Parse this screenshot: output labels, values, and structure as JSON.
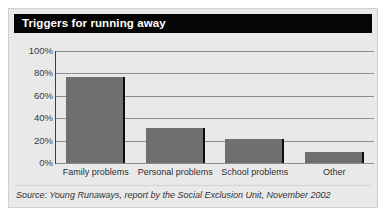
{
  "figure": {
    "title": "Triggers for running away",
    "source": "Source: Young Runaways, report by the Social Exclusion Unit, November 2002",
    "colors": {
      "title_bar": "#050505",
      "title_text": "#ffffff",
      "panel_background": "#e9e9e9",
      "bar_fill": "#6f6f6f",
      "bar_edge": "#0e0e0e",
      "gridline": "#8d8d8d",
      "axis": "#3d3d3d"
    }
  },
  "chart_data": {
    "type": "bar",
    "title": "Triggers for running away",
    "xlabel": "",
    "ylabel": "",
    "categories": [
      "Family problems",
      "Personal problems",
      "School problems",
      "Other"
    ],
    "values": [
      77,
      31,
      21,
      10
    ],
    "ylim": [
      0,
      100
    ],
    "yticks": [
      0,
      20,
      40,
      60,
      80,
      100
    ],
    "ytick_labels": [
      "0%",
      "20%",
      "40%",
      "60%",
      "80%",
      "100%"
    ],
    "grid": true,
    "legend": false,
    "annotations": [
      "Source: Young Runaways, report by the Social Exclusion Unit, November 2002"
    ]
  }
}
